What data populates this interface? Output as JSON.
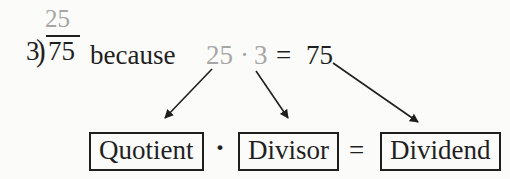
{
  "long_division": {
    "quotient": "25",
    "divisor": "3",
    "bracket": ")",
    "dividend": "75"
  },
  "statement": {
    "because": "because",
    "quotient_factor": "25",
    "dot": "·",
    "divisor_factor": "3",
    "equals": "=",
    "product": "75"
  },
  "term_boxes": {
    "quotient": "Quotient",
    "dot": "·",
    "divisor": "Divisor",
    "equals": "=",
    "dividend": "Dividend"
  },
  "colors": {
    "ink": "#1f1f1f",
    "muted": "#a6a6a6",
    "background": "#fbfbf9"
  }
}
